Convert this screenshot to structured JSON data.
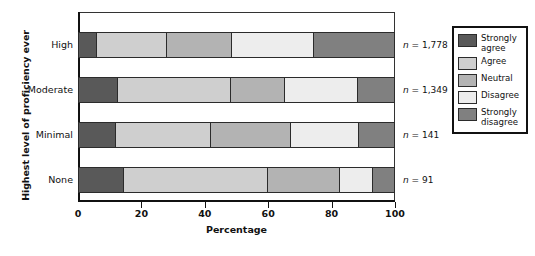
{
  "chart_data": {
    "type": "bar",
    "orientation": "horizontal",
    "stacked": true,
    "title": "",
    "xlabel": "Percentage",
    "ylabel": "Highest level of proficiency ever",
    "xlim": [
      0,
      100
    ],
    "xticks": [
      0,
      20,
      40,
      60,
      80,
      100
    ],
    "xtick_labels": [
      "0",
      "20",
      "40",
      "60",
      "80",
      "100"
    ],
    "grid": false,
    "legend_position": "right",
    "categories": [
      "High",
      "Moderate",
      "Minimal",
      "None"
    ],
    "series": [
      {
        "name": "Strongly agree",
        "color": "#595959",
        "values": [
          5.6,
          12.4,
          11.8,
          14.3
        ]
      },
      {
        "name": "Agree",
        "color": "#cfcfcf",
        "values": [
          22.4,
          35.7,
          30.0,
          45.7
        ]
      },
      {
        "name": "Neutral",
        "color": "#b3b3b3",
        "values": [
          20.5,
          17.4,
          25.5,
          23.0
        ]
      },
      {
        "name": "Disagree",
        "color": "#ededed",
        "values": [
          26.1,
          23.0,
          21.7,
          10.2
        ]
      },
      {
        "name": "Strongly disagree",
        "color": "#808080",
        "values": [
          25.4,
          11.5,
          11.0,
          6.8
        ]
      }
    ],
    "annotations": [
      {
        "category": "High",
        "label": "n = 1,778",
        "n": "1,778"
      },
      {
        "category": "Moderate",
        "label": "n = 1,349",
        "n": "1,349"
      },
      {
        "category": "Minimal",
        "label": "n = 141",
        "n": "141"
      },
      {
        "category": "None",
        "label": "n = 91",
        "n": "91"
      }
    ]
  },
  "axes": {
    "ylabel": "Highest level of proficiency ever",
    "xlabel": "Percentage",
    "ticks": [
      {
        "value": "0"
      },
      {
        "value": "20"
      },
      {
        "value": "40"
      },
      {
        "value": "60"
      },
      {
        "value": "80"
      },
      {
        "value": "100"
      }
    ]
  },
  "rows": [
    {
      "label": "High",
      "n_prefix": "n = ",
      "n": "1,778"
    },
    {
      "label": "Moderate",
      "n_prefix": "n = ",
      "n": "1,349"
    },
    {
      "label": "Minimal",
      "n_prefix": "n = ",
      "n": "141"
    },
    {
      "label": "None",
      "n_prefix": "n = ",
      "n": "91"
    }
  ],
  "legend": {
    "items": [
      {
        "label": "Strongly agree",
        "color": "#595959"
      },
      {
        "label": "Agree",
        "color": "#cfcfcf"
      },
      {
        "label": "Neutral",
        "color": "#b3b3b3"
      },
      {
        "label": "Disagree",
        "color": "#ededed"
      },
      {
        "label": "Strongly disagree",
        "color": "#808080"
      }
    ]
  }
}
